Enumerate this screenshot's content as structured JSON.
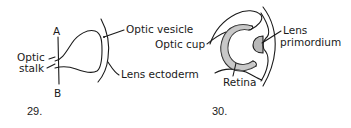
{
  "figures": [
    {
      "number": "29.",
      "labels": {
        "A": "A",
        "B": "B",
        "optic_stalk_line1": "Optic",
        "optic_stalk_line2": "stalk",
        "optic_vesicle": "Optic vesicle",
        "lens_ectoderm": "Lens ectoderm"
      }
    },
    {
      "number": "30.",
      "labels": {
        "optic_cup": "Optic cup",
        "retina": "Retina",
        "lens_line1": "Lens",
        "lens_line2": "primordium"
      }
    }
  ],
  "colors": {
    "ink": "#1a1a1a",
    "background": "#ffffff"
  }
}
